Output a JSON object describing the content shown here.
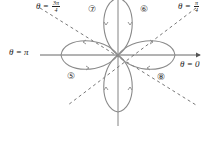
{
  "diagram": {
    "labels": {
      "theta_zero": "θ = 0",
      "theta_pi": "θ = π",
      "theta_pi_over_4_prefix": "θ =",
      "theta_pi_over_4_num": "π",
      "theta_pi_over_4_den": "4",
      "theta_3pi_over_4_prefix": "θ =",
      "theta_3pi_over_4_num": "3π",
      "theta_3pi_over_4_den": "4"
    },
    "regions": [
      {
        "id": "5",
        "glyph": "⑤",
        "position": "lower-left"
      },
      {
        "id": "6",
        "glyph": "⑥",
        "position": "upper-right"
      },
      {
        "id": "7",
        "glyph": "⑦",
        "position": "upper-left"
      },
      {
        "id": "8",
        "glyph": "⑧",
        "position": "lower-right"
      }
    ],
    "colors": {
      "curve": "#8a8a8a",
      "axis": "#555555",
      "dashed": "#555555",
      "text": "#222222"
    }
  }
}
